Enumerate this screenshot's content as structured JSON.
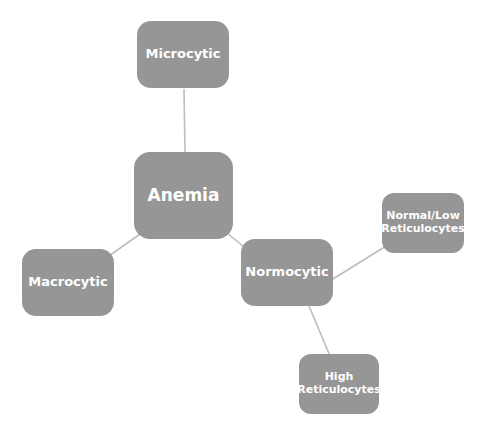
{
  "diagram": {
    "type": "mind-map",
    "style": {
      "node_fill": "#969696",
      "node_text_color": "#ffffff",
      "connector_color": "#bdbdbd",
      "background": "#ffffff"
    },
    "nodes": [
      {
        "id": "anemia",
        "label": "Anemia",
        "level": 0
      },
      {
        "id": "microcytic",
        "label": "Microcytic",
        "level": 1
      },
      {
        "id": "macrocytic",
        "label": "Macrocytic",
        "level": 1
      },
      {
        "id": "normocytic",
        "label": "Normocytic",
        "level": 1
      },
      {
        "id": "normal_low_retic",
        "label": "Normal/Low\nReticulocytes",
        "level": 2
      },
      {
        "id": "high_retic",
        "label": "High\nReticulocytes",
        "level": 2
      }
    ],
    "edges": [
      {
        "from": "anemia",
        "to": "microcytic"
      },
      {
        "from": "anemia",
        "to": "macrocytic"
      },
      {
        "from": "anemia",
        "to": "normocytic"
      },
      {
        "from": "normocytic",
        "to": "normal_low_retic"
      },
      {
        "from": "normocytic",
        "to": "high_retic"
      }
    ]
  }
}
